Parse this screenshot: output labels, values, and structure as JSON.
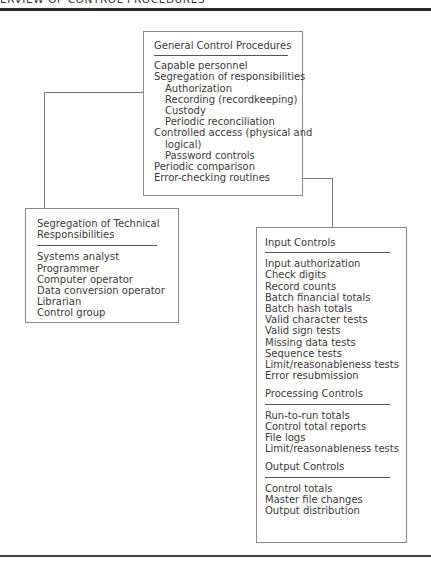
{
  "header": {
    "title": "ERVIEW OF CONTROL PROCEDURES"
  },
  "diagram": {
    "general": {
      "title": "General Control Procedures",
      "items": [
        {
          "label": "Capable personnel",
          "level": 0
        },
        {
          "label": "Segregation of responsibilities",
          "level": 0
        },
        {
          "label": "Authorization",
          "level": 1
        },
        {
          "label": "Recording (recordkeeping)",
          "level": 1
        },
        {
          "label": "Custody",
          "level": 1
        },
        {
          "label": "Periodic reconciliation",
          "level": 1
        },
        {
          "label": "Controlled access (physical and",
          "level": 0
        },
        {
          "label": "logical)",
          "level": 1
        },
        {
          "label": "Password controls",
          "level": 1
        },
        {
          "label": "Periodic comparison",
          "level": 0
        },
        {
          "label": "Error-checking routines",
          "level": 0
        }
      ]
    },
    "segregation": {
      "title_line1": "Segregation of Technical",
      "title_line2": "Responsibilities",
      "items": [
        "Systems analyst",
        "Programmer",
        "Computer operator",
        "Data conversion operator",
        "Librarian",
        "Control group"
      ]
    },
    "application": {
      "sections": [
        {
          "title": "Input Controls",
          "items": [
            "Input authorization",
            "Check digits",
            "Record counts",
            "Batch financial totals",
            "Batch hash totals",
            "Valid character tests",
            "Valid sign tests",
            "Missing data tests",
            "Sequence tests",
            "Limit/reasonableness tests",
            "Error resubmission"
          ]
        },
        {
          "title": "Processing Controls",
          "items": [
            "Run-to-run totals",
            "Control total reports",
            "File logs",
            "Limit/reasonableness tests"
          ]
        },
        {
          "title": "Output Controls",
          "items": [
            "Control totals",
            "Master file changes",
            "Output distribution"
          ]
        }
      ]
    }
  }
}
